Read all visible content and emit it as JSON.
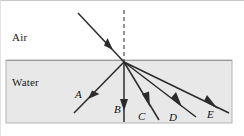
{
  "figure": {
    "width": 244,
    "height": 136,
    "background_color": "#ffffff",
    "frame_color": "#c9c9c9"
  },
  "regions": [
    {
      "id": "air",
      "label": "Air",
      "label_x": 12,
      "label_y": 31,
      "fill_color": "#ffffff"
    },
    {
      "id": "water",
      "label": "Water",
      "label_x": 12,
      "label_y": 76,
      "fill_color": "#e8e8e8",
      "border_color": "#b4b4b4",
      "rect": {
        "x": 6,
        "y": 60,
        "width": 226,
        "height": 63
      }
    }
  ],
  "interface": {
    "name": "air-water-boundary",
    "y": 61,
    "x_start": 6,
    "x_end": 232
  },
  "incidence_point": {
    "x": 124,
    "y": 62
  },
  "normal_line": {
    "name": "normal-dashed-line",
    "x": 124,
    "y_top": 10,
    "y_bottom": 62,
    "style": "dashed",
    "color": "#4d4d4d"
  },
  "incident_ray": {
    "name": "incident-ray",
    "x1": 78,
    "y1": 13,
    "x2": 124,
    "y2": 62,
    "arrow_x": 108,
    "arrow_y": 45,
    "color": "#2b2b2b"
  },
  "refracted_rays": [
    {
      "label": "A",
      "x1": 124,
      "y1": 62,
      "x2": 74,
      "y2": 113,
      "arrow_x": 95,
      "arrow_y": 92,
      "label_x": 75,
      "label_y": 88,
      "color": "#2b2b2b"
    },
    {
      "label": "B",
      "x1": 124,
      "y1": 62,
      "x2": 124,
      "y2": 122,
      "arrow_x": 124,
      "arrow_y": 104,
      "label_x": 114,
      "label_y": 103,
      "color": "#2b2b2b"
    },
    {
      "label": "C",
      "x1": 124,
      "y1": 62,
      "x2": 159,
      "y2": 120,
      "arrow_x": 146,
      "arrow_y": 99,
      "label_x": 138,
      "label_y": 110,
      "color": "#2b2b2b"
    },
    {
      "label": "D",
      "x1": 124,
      "y1": 62,
      "x2": 196,
      "y2": 117,
      "arrow_x": 177,
      "arrow_y": 102,
      "label_x": 169,
      "label_y": 111,
      "color": "#2b2b2b"
    },
    {
      "label": "E",
      "x1": 124,
      "y1": 62,
      "x2": 229,
      "y2": 113,
      "arrow_x": 211,
      "arrow_y": 104,
      "label_x": 207,
      "label_y": 108,
      "color": "#2b2b2b"
    }
  ]
}
